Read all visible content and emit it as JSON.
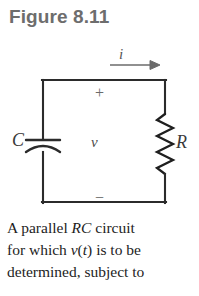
{
  "figure": {
    "title": "Figure 8.11",
    "title_color": "#6d6d6d",
    "background_color": "#ffffff",
    "line_color": "#2b2b2b"
  },
  "circuit": {
    "type": "parallel RC circuit",
    "current_label": "i",
    "current_direction": "right",
    "voltage_label": "v",
    "polarity_top": "+",
    "polarity_bottom": "−",
    "components": [
      {
        "symbol": "C",
        "name": "capacitor",
        "position": "left-branch"
      },
      {
        "symbol": "R",
        "name": "resistor",
        "position": "right-branch"
      }
    ]
  },
  "caption": {
    "line1_part1": "A parallel ",
    "line1_italic": "RC",
    "line1_part2": " circuit",
    "line2_part1": "for which ",
    "line2_italic_v": "v",
    "line2_paren_open": "(",
    "line2_italic_t": "t",
    "line2_paren_close": ")",
    "line2_part2": " is to be",
    "line3": "determined, subject to"
  }
}
